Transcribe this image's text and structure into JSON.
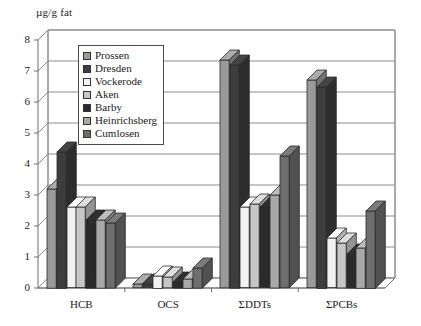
{
  "chart_data": {
    "type": "bar",
    "title": "",
    "ylabel": "µg/g fat",
    "xlabel": "",
    "ylim": [
      0,
      8
    ],
    "yticks": [
      0,
      1,
      2,
      3,
      4,
      5,
      6,
      7,
      8
    ],
    "grid": true,
    "legend_position": "upper-left-inside",
    "three_d": true,
    "categories": [
      "HCB",
      "OCS",
      "ΣDDTs",
      "ΣPCBs"
    ],
    "series": [
      {
        "name": "Prossen",
        "color": "#9a9a9a",
        "values": [
          3.2,
          0.12,
          7.35,
          6.7
        ]
      },
      {
        "name": "Dresden",
        "color": "#3d3d3d",
        "values": [
          4.4,
          0.12,
          7.2,
          6.5
        ]
      },
      {
        "name": "Vockerode",
        "color": "#f2f2f2",
        "values": [
          2.6,
          0.4,
          2.6,
          1.6
        ]
      },
      {
        "name": "Aken",
        "color": "#c6c6c6",
        "values": [
          2.6,
          0.35,
          2.7,
          1.45
        ]
      },
      {
        "name": "Barby",
        "color": "#2a2a2a",
        "values": [
          2.2,
          0.2,
          2.6,
          1.1
        ]
      },
      {
        "name": "Heinrichsberg",
        "color": "#a8a8a8",
        "values": [
          2.2,
          0.3,
          3.0,
          1.3
        ]
      },
      {
        "name": "Cumlosen",
        "color": "#6e6e6e",
        "values": [
          2.1,
          0.65,
          4.25,
          2.5
        ]
      }
    ]
  },
  "legend": {
    "items": [
      {
        "label": "Prossen"
      },
      {
        "label": "Dresden"
      },
      {
        "label": "Vockerode"
      },
      {
        "label": "Aken"
      },
      {
        "label": "Barby"
      },
      {
        "label": "Heinrichsberg"
      },
      {
        "label": "Cumlosen"
      }
    ]
  }
}
